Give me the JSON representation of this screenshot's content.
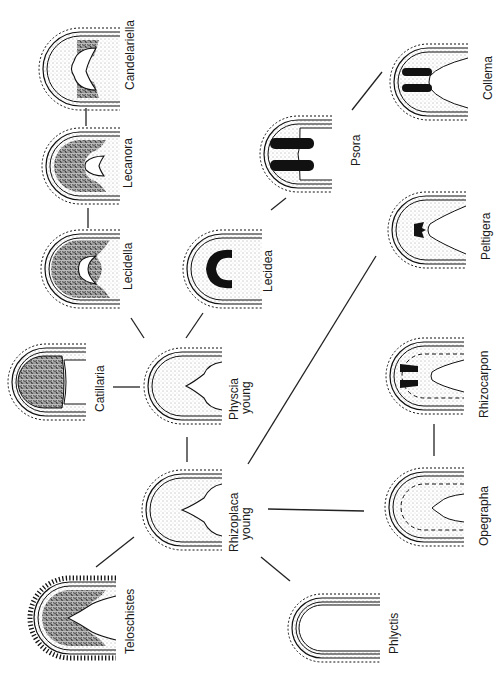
{
  "figure": {
    "orientation": "rotated-90-clockwise",
    "nodes": [
      {
        "id": "candelariella",
        "label": "Candelariella",
        "type": "lecanorine-dark-margin"
      },
      {
        "id": "lecanora",
        "label": "Lecanora",
        "type": "lecanorine-speckled"
      },
      {
        "id": "lecidella",
        "label": "Lecidella",
        "type": "lecanorine-speckled-full"
      },
      {
        "id": "lecidea",
        "label": "Lecidea",
        "type": "black-cup"
      },
      {
        "id": "psora",
        "label": "Psora",
        "type": "black-bars"
      },
      {
        "id": "collema",
        "label": "Collema",
        "type": "black-bars-small"
      },
      {
        "id": "catillaria",
        "label": "Catillaria",
        "type": "speckled-solid"
      },
      {
        "id": "physcia",
        "label": "Physcia",
        "sublabel": "young",
        "type": "stippled-v"
      },
      {
        "id": "peltigera",
        "label": "Peltigera",
        "type": "stippled-small-black"
      },
      {
        "id": "rhizoplaca",
        "label": "Rhizoplaca",
        "sublabel": "young",
        "type": "stippled-v"
      },
      {
        "id": "rhizocarpon",
        "label": "Rhizocarpon",
        "type": "stippled-dashed-black"
      },
      {
        "id": "teloschistes",
        "label": "Teloschistes",
        "type": "speckled-fringed"
      },
      {
        "id": "opegrapha",
        "label": "Opegrapha",
        "type": "stippled-dashed"
      },
      {
        "id": "phlyctis",
        "label": "Phlyctis",
        "type": "thin-simple"
      }
    ],
    "edges": [
      [
        "candelariella",
        "lecanora"
      ],
      [
        "lecanora",
        "lecidella"
      ],
      [
        "lecidella",
        "physcia"
      ],
      [
        "lecidea",
        "physcia"
      ],
      [
        "lecidea",
        "psora"
      ],
      [
        "psora",
        "collema"
      ],
      [
        "catillaria",
        "physcia"
      ],
      [
        "physcia",
        "rhizoplaca"
      ],
      [
        "rhizoplaca",
        "peltigera"
      ],
      [
        "rhizoplaca",
        "teloschistes"
      ],
      [
        "rhizoplaca",
        "opegrapha"
      ],
      [
        "rhizoplaca",
        "phlyctis"
      ],
      [
        "opegrapha",
        "rhizocarpon"
      ]
    ]
  }
}
